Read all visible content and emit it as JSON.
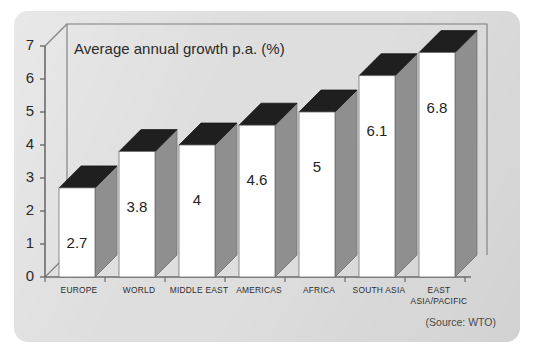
{
  "panel": {
    "background_color": "#dedede",
    "corner_radius": 14
  },
  "chart_data": {
    "type": "bar",
    "title": "Average annual growth p.a. (%)",
    "xlabel": "",
    "ylabel": "",
    "categories": [
      "EUROPE",
      "WORLD",
      "MIDDLE EAST",
      "AMERICAS",
      "AFRICA",
      "SOUTH ASIA",
      "EAST ASIA/PACIFIC"
    ],
    "category_label_lines": [
      [
        "EUROPE"
      ],
      [
        "WORLD"
      ],
      [
        "MIDDLE EAST"
      ],
      [
        "AMERICAS"
      ],
      [
        "AFRICA"
      ],
      [
        "SOUTH ASIA"
      ],
      [
        "EAST",
        "ASIA/PACIFIC"
      ]
    ],
    "values": [
      2.7,
      3.8,
      4,
      4.6,
      5,
      6.1,
      6.8
    ],
    "value_labels": [
      "2.7",
      "3.8",
      "4",
      "4.6",
      "5",
      "6.1",
      "6.8"
    ],
    "ylim": [
      0,
      7
    ],
    "yticks": [
      0,
      1,
      2,
      3,
      4,
      5,
      6,
      7
    ],
    "ytick_labels": [
      "0",
      "1",
      "2",
      "3",
      "4",
      "5",
      "6",
      "7"
    ],
    "grid": false,
    "legend": null,
    "style": "3d-column",
    "colors": {
      "bar_front": "#ffffff",
      "bar_top": "#1f1f1f",
      "bar_side": "#8f8f8f",
      "bar_floor": "#c2c2c2",
      "axis_line": "#6b6b6b",
      "frame_line": "#7a7a7a",
      "text": "#2b2b2b"
    }
  },
  "source": {
    "text": "(Source: WTO)"
  }
}
